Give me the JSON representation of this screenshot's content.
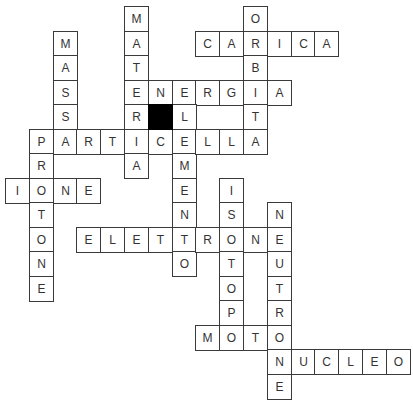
{
  "puzzle": {
    "type": "crossword",
    "grid": {
      "cell_w": 23.8,
      "cell_h": 24.5,
      "origin_x": 5,
      "origin_y": 6
    },
    "colors": {
      "border": "#3a3a3a",
      "text": "#333333",
      "black_cell": "#000000",
      "background": "#ffffff"
    },
    "black_cells": [
      {
        "row": 4,
        "col": 6
      }
    ],
    "words": [
      {
        "word": "MATERIA",
        "direction": "down",
        "row": 0,
        "col": 5
      },
      {
        "word": "ORBITA",
        "direction": "down",
        "row": 0,
        "col": 10
      },
      {
        "word": "CARICA",
        "direction": "across",
        "row": 1,
        "col": 8
      },
      {
        "word": "MASSA",
        "direction": "down",
        "row": 1,
        "col": 2
      },
      {
        "word": "ENERGIA",
        "direction": "across",
        "row": 3,
        "col": 5
      },
      {
        "word": "ELEMENTO",
        "direction": "down",
        "row": 3,
        "col": 7
      },
      {
        "word": "PARTICELLA",
        "direction": "across",
        "row": 5,
        "col": 1
      },
      {
        "word": "PROTONE",
        "direction": "down",
        "row": 5,
        "col": 1
      },
      {
        "word": "IONE",
        "direction": "across",
        "row": 7,
        "col": 0
      },
      {
        "word": "ISOTOPO",
        "direction": "down",
        "row": 7,
        "col": 9
      },
      {
        "word": "NEUTRONE",
        "direction": "down",
        "row": 8,
        "col": 11
      },
      {
        "word": "ELETTRONE",
        "direction": "across",
        "row": 9,
        "col": 3
      },
      {
        "word": "MOTO",
        "direction": "across",
        "row": 13,
        "col": 8
      },
      {
        "word": "NUCLEO",
        "direction": "across",
        "row": 14,
        "col": 11
      }
    ]
  }
}
